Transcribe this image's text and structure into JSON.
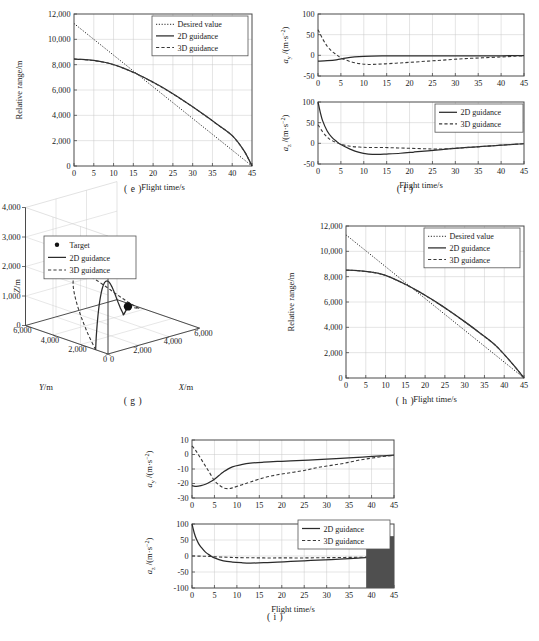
{
  "figure": {
    "captions": {
      "e": "( e )",
      "f": "( f )",
      "g": "( g )",
      "h": "( h )",
      "i": "( i )"
    }
  },
  "labels": {
    "flight_time": "Flight time/s",
    "relative_range": "Relative range/m",
    "ay": "a_y /(m·s−2)",
    "az": "a_z /(m·s−2)",
    "ay_sym": "a",
    "ay_sub": "y",
    "az_sub": "z",
    "accel_unit": "/(m·s",
    "accel_exp": "−2",
    "x_m": "X/m",
    "y_m": "Y/m",
    "z_m": "Z/m"
  },
  "legend_entries": {
    "desired": "Desired value",
    "guidance2d": "2D guidance",
    "guidance3d": "3D guidance",
    "target": "Target"
  },
  "chart_data": [
    {
      "id": "e",
      "type": "line",
      "title": "( e )",
      "xlabel": "Flight time/s",
      "ylabel": "Relative range/m",
      "xlim": [
        0,
        45
      ],
      "ylim": [
        0,
        12000
      ],
      "xticks": [
        0,
        5,
        10,
        15,
        20,
        25,
        30,
        35,
        40,
        45
      ],
      "yticks": [
        0,
        2000,
        4000,
        6000,
        8000,
        10000,
        12000
      ],
      "ytick_labels": [
        "0",
        "2,000",
        "4,000",
        "6,000",
        "8,000",
        "10,000",
        "12,000"
      ],
      "grid": true,
      "legend_position": "top-right",
      "legend": [
        "Desired value",
        "2D guidance",
        "3D guidance"
      ],
      "series": [
        {
          "name": "Desired value",
          "style": "dotted",
          "x": [
            0,
            5,
            10,
            15,
            20,
            25,
            30,
            35,
            40,
            45
          ],
          "values": [
            11250,
            10000,
            8750,
            7500,
            6250,
            5000,
            3750,
            2500,
            1250,
            0
          ]
        },
        {
          "name": "2D guidance",
          "style": "solid",
          "x": [
            0,
            2,
            5,
            8,
            10,
            12,
            15,
            18,
            20,
            22,
            25,
            28,
            30,
            33,
            36,
            40,
            43,
            45
          ],
          "values": [
            8450,
            8420,
            8330,
            8170,
            8000,
            7790,
            7400,
            6950,
            6620,
            6270,
            5700,
            5100,
            4680,
            4020,
            3340,
            2400,
            1200,
            0
          ]
        },
        {
          "name": "3D guidance",
          "style": "dashed",
          "x": [
            0,
            2,
            5,
            8,
            10,
            12,
            15,
            18,
            20,
            22,
            25,
            28,
            30,
            33,
            36,
            40,
            43,
            45
          ],
          "values": [
            8440,
            8410,
            8320,
            8160,
            7990,
            7780,
            7390,
            6940,
            6600,
            6250,
            5690,
            5090,
            4670,
            4010,
            3330,
            2390,
            1190,
            0
          ]
        }
      ]
    },
    {
      "id": "f_top",
      "type": "line",
      "xlabel": "",
      "ylabel": "a_y /(m·s−2)",
      "xlim": [
        0,
        45
      ],
      "ylim": [
        -50,
        100
      ],
      "xticks": [
        0,
        5,
        10,
        15,
        20,
        25,
        30,
        35,
        40,
        45
      ],
      "yticks": [
        -50,
        0,
        50,
        100
      ],
      "grid": true,
      "series": [
        {
          "name": "2D guidance",
          "style": "solid",
          "x": [
            0,
            2,
            4,
            6,
            8,
            10,
            14,
            18,
            22,
            26,
            30,
            35,
            40,
            45
          ],
          "values": [
            -14,
            -13,
            -11,
            -7,
            -4,
            -2.5,
            -1.5,
            -1.2,
            -1.2,
            -1.3,
            -1.4,
            -1.4,
            -1.2,
            -0.5
          ]
        },
        {
          "name": "3D guidance",
          "style": "dashed",
          "x": [
            0,
            1,
            2,
            3,
            4,
            5,
            7,
            9,
            11,
            14,
            17,
            20,
            24,
            28,
            32,
            36,
            40,
            43,
            45
          ],
          "values": [
            62,
            40,
            22,
            10,
            2,
            -6,
            -15,
            -20,
            -22,
            -21,
            -19,
            -17,
            -14,
            -11,
            -8,
            -6,
            -4,
            -2,
            -1
          ]
        }
      ]
    },
    {
      "id": "f_bottom",
      "type": "line",
      "xlabel": "Flight time/s",
      "ylabel": "a_z /(m·s−2)",
      "xlim": [
        0,
        45
      ],
      "ylim": [
        -50,
        100
      ],
      "xticks": [
        0,
        5,
        10,
        15,
        20,
        25,
        30,
        35,
        40,
        45
      ],
      "yticks": [
        -50,
        0,
        50,
        100
      ],
      "grid": true,
      "legend_position": "top-right",
      "legend": [
        "2D guidance",
        "3D guidance"
      ],
      "series": [
        {
          "name": "2D guidance",
          "style": "solid",
          "x": [
            0,
            0.5,
            1,
            2,
            3,
            4,
            5,
            7,
            9,
            11,
            13,
            15,
            18,
            21,
            24,
            27,
            30,
            34,
            38,
            42,
            45
          ],
          "values": [
            100,
            75,
            55,
            30,
            15,
            5,
            -3,
            -14,
            -22,
            -26,
            -27,
            -26,
            -24,
            -21,
            -18,
            -15,
            -12,
            -9,
            -6,
            -3,
            -1
          ]
        },
        {
          "name": "3D guidance",
          "style": "dashed",
          "x": [
            0,
            1,
            2,
            3,
            5,
            7,
            9,
            11,
            14,
            17,
            20,
            23,
            26,
            30,
            34,
            38,
            42,
            45
          ],
          "values": [
            45,
            28,
            15,
            7,
            -2,
            -7,
            -9,
            -10,
            -10,
            -11,
            -12,
            -13,
            -14,
            -12,
            -9,
            -6,
            -3,
            -1
          ]
        }
      ]
    },
    {
      "id": "g",
      "type": "line3d",
      "xlabel": "X/m",
      "ylabel": "Y/m",
      "zlabel": "Z/m",
      "xlim": [
        0,
        6000
      ],
      "ylim": [
        0,
        6000
      ],
      "zlim": [
        0,
        4000
      ],
      "xticks": [
        0,
        2000,
        4000,
        6000
      ],
      "xtick_labels": [
        "0",
        "2,000",
        "4,000",
        "6,000"
      ],
      "yticks": [
        0,
        2000,
        4000,
        6000
      ],
      "ytick_labels": [
        "0",
        "2,000",
        "4,000",
        "6,000"
      ],
      "zticks": [
        0,
        1000,
        2000,
        3000,
        4000
      ],
      "ztick_labels": [
        "0",
        "1,000",
        "2,000",
        "3,000",
        "4,000"
      ],
      "legend_position": "top-left",
      "legend": [
        "Target",
        "2D guidance",
        "3D guidance"
      ],
      "target_point": {
        "x": 2300,
        "y": 1100,
        "z": 1100
      }
    },
    {
      "id": "h",
      "type": "line",
      "title": "( h )",
      "xlabel": "Flight time/s",
      "ylabel": "Relative range/m",
      "xlim": [
        0,
        45
      ],
      "ylim": [
        0,
        12000
      ],
      "xticks": [
        0,
        5,
        10,
        15,
        20,
        25,
        30,
        35,
        40,
        45
      ],
      "yticks": [
        0,
        2000,
        4000,
        6000,
        8000,
        10000,
        12000
      ],
      "ytick_labels": [
        "0",
        "2,000",
        "4,000",
        "6,000",
        "8,000",
        "10,000",
        "12,000"
      ],
      "grid": true,
      "legend_position": "top-right",
      "legend": [
        "Desired value",
        "2D guidance",
        "3D guidance"
      ],
      "series": [
        {
          "name": "Desired value",
          "style": "dotted",
          "x": [
            0,
            5,
            10,
            15,
            20,
            25,
            30,
            35,
            40,
            45
          ],
          "values": [
            11300,
            10045,
            8790,
            7530,
            6275,
            5020,
            3765,
            2510,
            1255,
            0
          ]
        },
        {
          "name": "2D guidance",
          "style": "solid",
          "x": [
            0,
            3,
            6,
            8,
            10,
            12,
            15,
            18,
            20,
            23,
            26,
            30,
            34,
            38,
            42,
            45
          ],
          "values": [
            8520,
            8480,
            8380,
            8280,
            8100,
            7850,
            7400,
            6900,
            6530,
            5950,
            5330,
            4450,
            3520,
            2520,
            1150,
            0
          ]
        },
        {
          "name": "3D guidance",
          "style": "dashed",
          "x": [
            0,
            3,
            6,
            8,
            10,
            12,
            15,
            18,
            20,
            23,
            26,
            30,
            34,
            38,
            42,
            45
          ],
          "values": [
            8510,
            8470,
            8370,
            8270,
            8090,
            7840,
            7390,
            6890,
            6520,
            5940,
            5320,
            4440,
            3510,
            2510,
            1145,
            0
          ]
        }
      ]
    },
    {
      "id": "i_top",
      "type": "line",
      "xlabel": "",
      "ylabel": "a_y /(m·s−2)",
      "xlim": [
        0,
        45
      ],
      "ylim": [
        -30,
        10
      ],
      "xticks": [
        0,
        5,
        10,
        15,
        20,
        25,
        30,
        35,
        40,
        45
      ],
      "yticks": [
        -30,
        -20,
        -10,
        0,
        10
      ],
      "grid": true,
      "series": [
        {
          "name": "2D guidance",
          "style": "solid",
          "x": [
            0,
            1,
            2,
            3,
            4,
            5,
            6,
            7,
            9,
            11,
            13,
            16,
            19,
            22,
            26,
            30,
            34,
            38,
            42,
            45
          ],
          "values": [
            -21.5,
            -22,
            -21.5,
            -20.5,
            -19,
            -17,
            -14.5,
            -12,
            -8.5,
            -7,
            -6,
            -5.3,
            -4.8,
            -4.4,
            -3.8,
            -3.2,
            -2.5,
            -1.8,
            -1,
            -0.4
          ]
        },
        {
          "name": "3D guidance",
          "style": "dashed",
          "x": [
            0,
            1,
            2,
            3,
            4,
            5,
            6,
            7,
            8,
            9,
            11,
            13,
            16,
            19,
            22,
            25,
            28,
            31,
            34,
            37,
            40,
            43,
            45
          ],
          "values": [
            6,
            2,
            -3,
            -8,
            -13,
            -18,
            -21,
            -23,
            -23.5,
            -23,
            -21,
            -19,
            -16,
            -14,
            -12.5,
            -11,
            -9,
            -7.5,
            -6,
            -4,
            -2.5,
            -1.2,
            -0.6
          ]
        }
      ]
    },
    {
      "id": "i_bottom",
      "type": "line",
      "xlabel": "Flight time/s",
      "ylabel": "a_z /(m·s−2)",
      "xlim": [
        0,
        45
      ],
      "ylim": [
        -100,
        100
      ],
      "xticks": [
        0,
        5,
        10,
        15,
        20,
        25,
        30,
        35,
        40,
        45
      ],
      "yticks": [
        -100,
        -50,
        0,
        50,
        100
      ],
      "grid": true,
      "legend_position": "top-right",
      "legend": [
        "2D guidance",
        "3D guidance"
      ],
      "artifact_rect": {
        "x0": 38.8,
        "x1": 45,
        "y0": -100,
        "y1": 62
      },
      "series": [
        {
          "name": "2D guidance",
          "style": "solid",
          "x": [
            0,
            0.5,
            1,
            1.5,
            2,
            3,
            4,
            5,
            7,
            9,
            11,
            13,
            16,
            19,
            22,
            25,
            28,
            31,
            34,
            37,
            39
          ],
          "values": [
            100,
            72,
            52,
            38,
            28,
            12,
            2,
            -6,
            -15,
            -19,
            -21,
            -22,
            -21,
            -19,
            -17,
            -15,
            -13,
            -11,
            -9,
            -7,
            -5
          ]
        },
        {
          "name": "3D guidance",
          "style": "dashed",
          "x": [
            0,
            2,
            4,
            6,
            8,
            10,
            13,
            16,
            19,
            22,
            25,
            28,
            31,
            34,
            37,
            39
          ],
          "values": [
            0,
            -0.5,
            -1.5,
            -3,
            -4,
            -5,
            -5.5,
            -6,
            -6,
            -6,
            -6,
            -5.5,
            -5,
            -4.5,
            -4,
            -3.5
          ]
        }
      ]
    }
  ]
}
